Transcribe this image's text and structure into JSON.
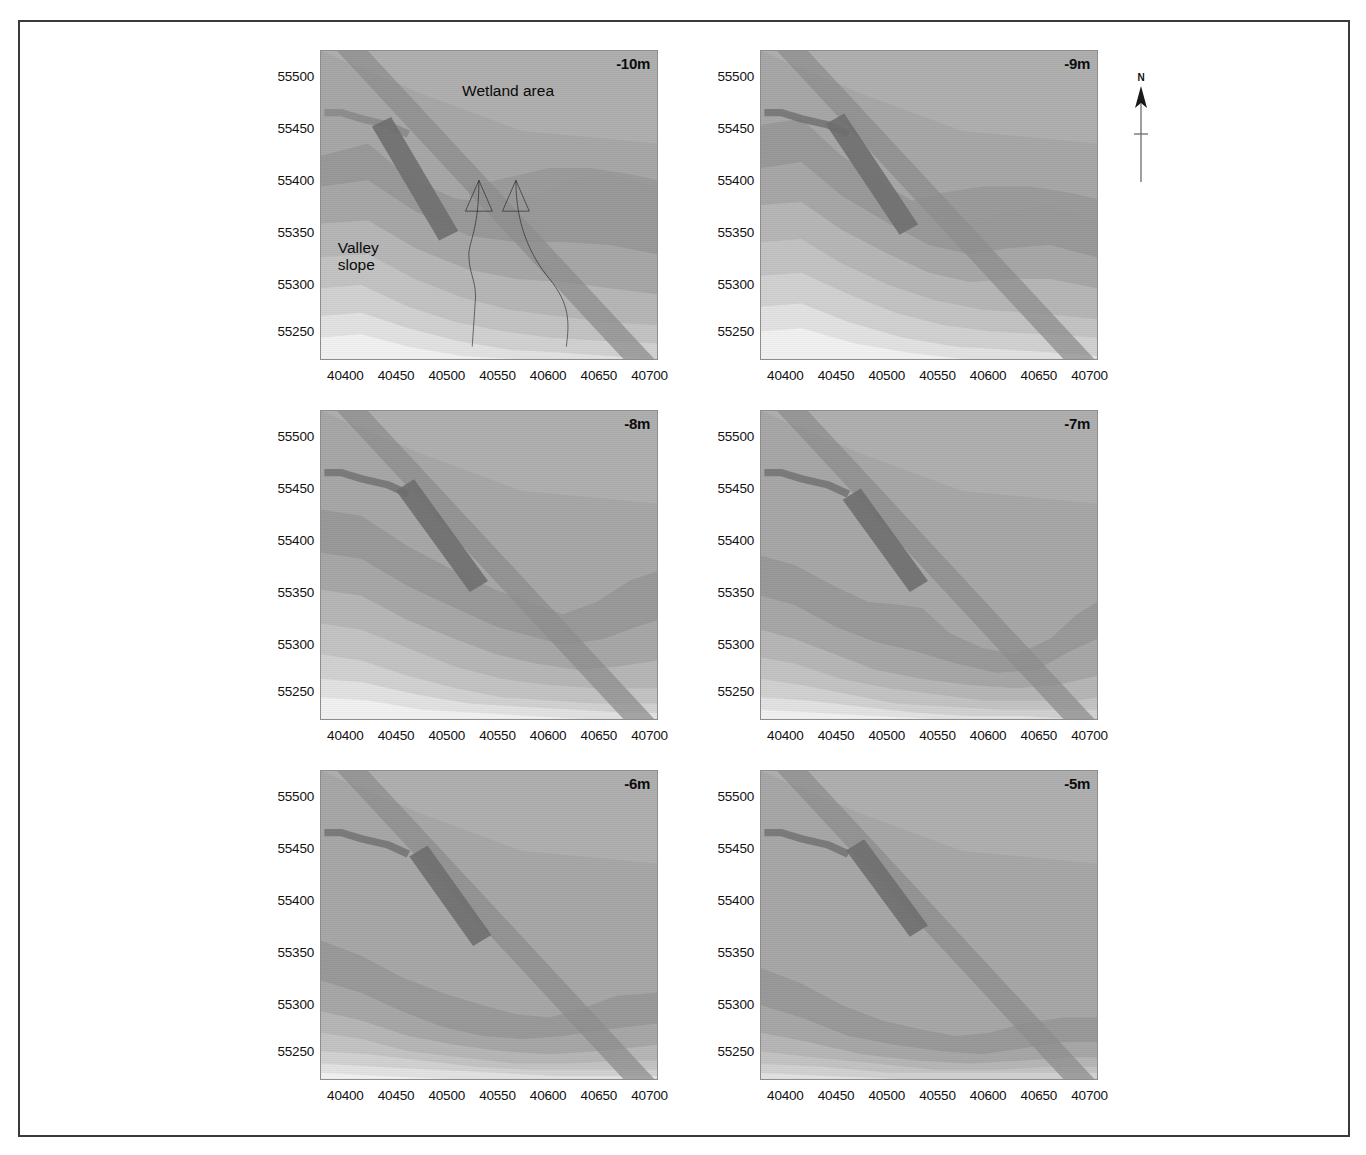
{
  "figure": {
    "type": "geophysical-depth-slice-map-grid",
    "rows": 3,
    "columns": 2,
    "north_arrow": {
      "label": "N"
    }
  },
  "axes": {
    "x_ticks": [
      "40400",
      "40450",
      "40500",
      "40550",
      "40600",
      "40650",
      "40700"
    ],
    "y_ticks": [
      "55500",
      "55450",
      "55400",
      "55350",
      "55300",
      "55250"
    ],
    "x_range": [
      40380,
      40710
    ],
    "y_range": [
      55225,
      55520
    ]
  },
  "annotations": {
    "wetland": "Wetland area",
    "valley": "Valley\nslope"
  },
  "colors": {
    "band_1_lightest": "#f2f2f2",
    "band_2": "#e3e3e3",
    "band_3": "#d2d2d2",
    "band_4": "#c4c4c4",
    "band_5": "#b7b7b7",
    "band_6": "#a8a8a8",
    "band_7_darkest": "#9a9a9a",
    "anomaly_medium": "#8f8f8f",
    "anomaly_dark": "#717171",
    "frame": "#3a3a3a"
  },
  "panels": [
    {
      "depth_label": "-10m",
      "depth_m": -10,
      "row": 0,
      "col": 0
    },
    {
      "depth_label": "-9m",
      "depth_m": -9,
      "row": 0,
      "col": 1
    },
    {
      "depth_label": "-8m",
      "depth_m": -8,
      "row": 1,
      "col": 0
    },
    {
      "depth_label": "-7m",
      "depth_m": -7,
      "row": 1,
      "col": 1
    },
    {
      "depth_label": "-6m",
      "depth_m": -6,
      "row": 2,
      "col": 0
    },
    {
      "depth_label": "-5m",
      "depth_m": -5,
      "row": 2,
      "col": 1
    }
  ],
  "chart_data": {
    "type": "heatmap",
    "title": "",
    "xlabel": "",
    "ylabel": "",
    "xlim": [
      40380,
      40710
    ],
    "ylim": [
      55225,
      55520
    ],
    "grid": false,
    "legend": "none",
    "panel_variable": "depth",
    "panel_values": [
      -10,
      -9,
      -8,
      -7,
      -6,
      -5
    ],
    "panel_unit": "m",
    "colormap": "grayscale-banded",
    "series": [
      {
        "name": "-10m",
        "values": []
      },
      {
        "name": "-9m",
        "values": []
      },
      {
        "name": "-8m",
        "values": []
      },
      {
        "name": "-7m",
        "values": []
      },
      {
        "name": "-6m",
        "values": []
      },
      {
        "name": "-5m",
        "values": []
      }
    ]
  }
}
